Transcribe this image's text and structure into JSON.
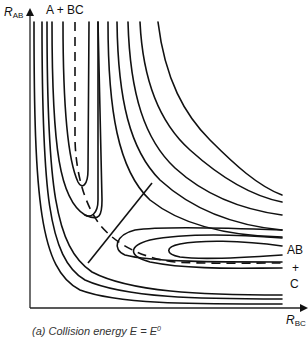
{
  "diagram": {
    "y_axis": {
      "symbol": "R",
      "subscript": "AB"
    },
    "x_axis": {
      "symbol": "R",
      "subscript": "BC"
    },
    "labels": {
      "reactants": "A + BC",
      "products_line1": "AB",
      "products_line2": "+",
      "products_line3": "C"
    },
    "caption": {
      "prefix": "(a) Collision energy ",
      "variable": "E",
      "equals": " = ",
      "rhs": "E",
      "rhs_superscript": "0"
    },
    "elements": {
      "reaction_path": "dashed minimum energy path",
      "transition_line": "dividing line through saddle point",
      "contours": "equipotential contour lines"
    }
  }
}
